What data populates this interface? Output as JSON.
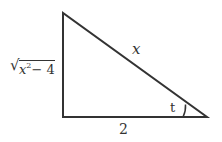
{
  "diagram": {
    "type": "right-triangle",
    "vertices": {
      "top": [
        63,
        13
      ],
      "right_angle": [
        63,
        117
      ],
      "right": [
        207,
        117
      ]
    },
    "stroke_color": "#333333",
    "labels": {
      "hypotenuse": "x",
      "base": "2",
      "vertical_side_var": "x",
      "vertical_side_exp": "2",
      "vertical_side_rest": "− 4",
      "vertical_side_sqrt": "√",
      "angle": "t"
    }
  }
}
